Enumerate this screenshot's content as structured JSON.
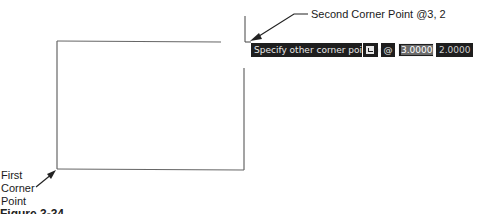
{
  "annotations": {
    "second_corner": "Second Corner Point @3, 2",
    "first_corner_line1": "First",
    "first_corner_line2": "Corner",
    "first_corner_line3": "Point"
  },
  "dynamic_input": {
    "prompt": "Specify other corner point or",
    "options_icon": "down-arrow-options-icon",
    "relative_symbol": "@",
    "x_value": "3.0000",
    "y_value": "2.0000"
  },
  "caption": "Figure 3-34",
  "colors": {
    "tooltip_bg": "#1e1e1e",
    "tooltip_text": "#e8e8e8",
    "line": "#555555"
  }
}
